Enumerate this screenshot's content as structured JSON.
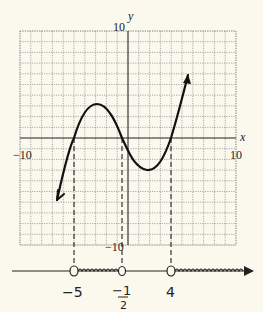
{
  "graph": {
    "x_axis_label": "x",
    "y_axis_label": "y",
    "x_min_label": "−10",
    "x_max_label": "10",
    "y_max_label": "10",
    "y_min_label": "−10",
    "xlim": [
      -10,
      10
    ],
    "ylim": [
      -10,
      10
    ],
    "grid": true
  },
  "curve": {
    "description": "cubic polynomial with roots at -5, -1/2, 4",
    "roots": [
      -5,
      -0.5,
      4
    ],
    "local_max": [
      -3,
      3.2
    ],
    "local_min": [
      1.8,
      -3
    ],
    "left_end": [
      -6.6,
      -5.8
    ],
    "right_end": [
      5.6,
      5.9
    ]
  },
  "number_line": {
    "points": [
      {
        "label": "−5",
        "value": -5,
        "open": true
      },
      {
        "label": "−1/2",
        "label_num": "−1",
        "label_den": "2",
        "value": -0.5,
        "open": true
      },
      {
        "label": "4",
        "value": 4,
        "open": true
      }
    ],
    "shaded_intervals": [
      [
        -5,
        -0.5
      ],
      [
        4,
        "infinity"
      ]
    ]
  },
  "chart_data": {
    "type": "line",
    "title": "",
    "xlabel": "x",
    "ylabel": "y",
    "xlim": [
      -10,
      10
    ],
    "ylim": [
      -10,
      10
    ],
    "series": [
      {
        "name": "f(x)",
        "x": [
          -6.6,
          -5,
          -4,
          -3,
          -2,
          -1,
          -0.5,
          0,
          1,
          1.8,
          3,
          4,
          5,
          5.6
        ],
        "y": [
          -5.8,
          0,
          2.6,
          3.2,
          2.6,
          1.0,
          0,
          -1.2,
          -2.7,
          -3.0,
          -2.0,
          0,
          3.4,
          5.9
        ]
      }
    ],
    "annotations": [
      "roots at x = -5, -1/2, 4 marked by dashed vertical lines",
      "solution set on number line: (-5, -1/2) U (4, infinity)"
    ]
  }
}
